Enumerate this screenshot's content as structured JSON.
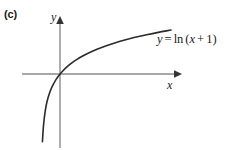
{
  "figure": {
    "part_label": "(c)",
    "background_color": "#ffffff",
    "axis_color": "#8a8a8a",
    "curve_color": "#2b2b2b",
    "text_color": "#1a1a1a"
  },
  "equation": {
    "lhs": "y",
    "equals": "=",
    "fn": "ln",
    "open_paren": "(",
    "arg_var": "x",
    "plus": "+",
    "arg_const": "1",
    "close_paren": ")",
    "full_text": "y = ln (x + 1)"
  },
  "axes": {
    "x_label": "x",
    "y_label": "y"
  },
  "chart_data": {
    "type": "line",
    "title": "",
    "subtitle": "",
    "xlabel": "x",
    "ylabel": "y",
    "legend": [],
    "legend_position": "none",
    "grid": false,
    "annotations": [
      {
        "text": "y = ln (x + 1)",
        "x": 5.5,
        "y": 1.85
      },
      {
        "text": "(c)",
        "x": null,
        "y": null
      }
    ],
    "xlim": [
      -1.6,
      6.6
    ],
    "ylim": [
      -4.0,
      2.6
    ],
    "vertical_asymptote": -1,
    "x_intercept": 0,
    "y_intercept": 0,
    "series": [
      {
        "name": "y = ln(x + 1)",
        "color": "#2b2b2b",
        "x": [
          -0.975,
          -0.95,
          -0.9,
          -0.8,
          -0.7,
          -0.6,
          -0.5,
          -0.4,
          -0.3,
          -0.2,
          -0.1,
          0,
          0.25,
          0.5,
          0.75,
          1,
          1.5,
          2,
          2.5,
          3,
          3.5,
          4,
          4.5,
          5,
          5.5,
          6
        ],
        "y": [
          -3.69,
          -3.0,
          -2.3,
          -1.61,
          -1.2,
          -0.92,
          -0.69,
          -0.51,
          -0.36,
          -0.22,
          -0.105,
          0,
          0.223,
          0.405,
          0.56,
          0.693,
          0.916,
          1.099,
          1.253,
          1.386,
          1.504,
          1.609,
          1.705,
          1.792,
          1.872,
          1.946
        ]
      }
    ]
  }
}
